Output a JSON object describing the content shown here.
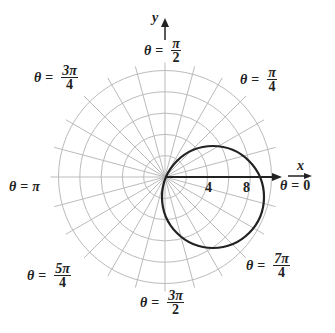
{
  "figure": {
    "curve_equation_estimate": "r = 10 cos(θ + π/8)",
    "axis_x_label": "x",
    "axis_y_label": "y",
    "tick_labels": [
      "4",
      "8"
    ],
    "angle_labels": [
      {
        "id": "east",
        "theta": "θ",
        "eq": "=",
        "num": "0",
        "den": ""
      },
      {
        "id": "ne",
        "theta": "θ",
        "eq": "=",
        "num": "π",
        "den": "4"
      },
      {
        "id": "north",
        "theta": "θ",
        "eq": "=",
        "num": "π",
        "den": "2"
      },
      {
        "id": "nw",
        "theta": "θ",
        "eq": "=",
        "num": "3π",
        "den": "4"
      },
      {
        "id": "west",
        "theta": "θ",
        "eq": "=",
        "num": "π",
        "den": ""
      },
      {
        "id": "sw",
        "theta": "θ",
        "eq": "=",
        "num": "5π",
        "den": "4"
      },
      {
        "id": "south",
        "theta": "θ",
        "eq": "=",
        "num": "3π",
        "den": "2"
      },
      {
        "id": "se",
        "theta": "θ",
        "eq": "=",
        "num": "7π",
        "den": "4"
      }
    ]
  },
  "colors": {
    "grid": "#bbbbbb",
    "curve": "#222222",
    "axis": "#222222"
  }
}
